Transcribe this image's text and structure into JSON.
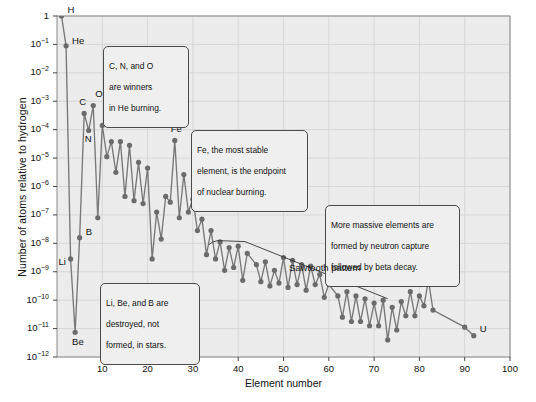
{
  "chart_data": {
    "type": "scatter",
    "title": "",
    "xlabel": "Element number",
    "ylabel": "Number of atoms relative to hydrogen",
    "xlim": [
      0,
      100
    ],
    "ylim_log10": [
      -12,
      0
    ],
    "xticks": [
      "10",
      "20",
      "30",
      "40",
      "50",
      "60",
      "70",
      "80",
      "90",
      "100"
    ],
    "xtick_values": [
      10,
      20,
      30,
      40,
      50,
      60,
      70,
      80,
      90,
      100
    ],
    "yticks": [
      "1",
      "10-1",
      "10-2",
      "10-3",
      "10-4",
      "10-5",
      "10-6",
      "10-7",
      "10-8",
      "10-9",
      "10-10",
      "10-11",
      "10-12"
    ],
    "ytick_exponents": [
      0,
      -1,
      -2,
      -3,
      -4,
      -5,
      -6,
      -7,
      -8,
      -9,
      -10,
      -11,
      -12
    ],
    "grid": true,
    "marker_color": "#6b6b6b",
    "line_color": "#777777",
    "plot_bg": "#ececec",
    "x": [
      1,
      2,
      3,
      4,
      5,
      6,
      7,
      8,
      9,
      10,
      11,
      12,
      13,
      14,
      15,
      16,
      17,
      18,
      19,
      20,
      21,
      22,
      23,
      24,
      25,
      26,
      27,
      28,
      29,
      30,
      31,
      32,
      33,
      34,
      35,
      36,
      37,
      38,
      39,
      40,
      41,
      42,
      44,
      45,
      46,
      47,
      48,
      49,
      50,
      51,
      52,
      53,
      54,
      55,
      56,
      57,
      58,
      59,
      60,
      62,
      63,
      64,
      65,
      66,
      67,
      68,
      69,
      70,
      71,
      72,
      73,
      74,
      75,
      76,
      77,
      78,
      79,
      80,
      81,
      82,
      83,
      90,
      92
    ],
    "y_log10": [
      0,
      -1.05,
      -8.55,
      -11.13,
      -7.8,
      -3.43,
      -4.03,
      -3.15,
      -7.1,
      -3.85,
      -4.95,
      -4.42,
      -5.5,
      -4.42,
      -6.35,
      -4.55,
      -6.5,
      -5.15,
      -6.6,
      -5.35,
      -8.55,
      -6.9,
      -7.85,
      -6.35,
      -6.55,
      -4.38,
      -7.1,
      -5.58,
      -6.9,
      -6.45,
      -7.55,
      -7.15,
      -8.4,
      -7.55,
      -8.55,
      -7.95,
      -8.95,
      -8.15,
      -8.85,
      -8.1,
      -9.3,
      -8.35,
      -8.75,
      -9.35,
      -8.65,
      -9.5,
      -8.95,
      -9.4,
      -8.5,
      -9.55,
      -8.6,
      -9.45,
      -8.75,
      -9.65,
      -8.8,
      -9.45,
      -9.1,
      -9.9,
      -9.45,
      -9.85,
      -10.6,
      -9.7,
      -10.75,
      -9.85,
      -10.75,
      -9.95,
      -10.9,
      -10.1,
      -10.9,
      -10.0,
      -11.4,
      -10.25,
      -11.05,
      -10.05,
      -10.55,
      -9.7,
      -10.55,
      -9.85,
      -10.2,
      -9.3,
      -10.35,
      -10.95,
      -11.25
    ],
    "labeled_points": [
      {
        "label": "H",
        "element": 1,
        "log10": 0
      },
      {
        "label": "He",
        "element": 2,
        "log10": -1.05
      },
      {
        "label": "Li",
        "element": 3,
        "log10": -8.55
      },
      {
        "label": "Be",
        "element": 4,
        "log10": -11.13
      },
      {
        "label": "B",
        "element": 5,
        "log10": -7.8
      },
      {
        "label": "C",
        "element": 6,
        "log10": -3.43
      },
      {
        "label": "N",
        "element": 7,
        "log10": -4.03
      },
      {
        "label": "O",
        "element": 8,
        "log10": -3.15
      },
      {
        "label": "Fe",
        "element": 26,
        "log10": -4.38
      },
      {
        "label": "U",
        "element": 92,
        "log10": -11.25
      }
    ],
    "annotations": [
      {
        "name": "sawtooth",
        "text": "Sawtooth pattern"
      }
    ],
    "callouts": [
      {
        "name": "he-burning",
        "text": "C, N, and O\nare winners\nin He burning."
      },
      {
        "name": "iron-endpoint",
        "text": "Fe, the most stable\nelement, is the endpoint\nof nuclear burning."
      },
      {
        "name": "neutron-capture",
        "text": "More massive elements are\nformed by neutron capture\nfollowed by beta decay."
      },
      {
        "name": "light-destroyed",
        "text": "Li, Be, and B are\ndestroyed, not\nformed, in stars."
      }
    ]
  },
  "axis": {
    "ylabel": "Number of atoms relative to hydrogen",
    "xlabel": "Element number"
  },
  "ytick_labels": [
    {
      "mantissa": "1",
      "exp": ""
    },
    {
      "mantissa": "10",
      "exp": "−1"
    },
    {
      "mantissa": "10",
      "exp": "−2"
    },
    {
      "mantissa": "10",
      "exp": "−3"
    },
    {
      "mantissa": "10",
      "exp": "−4"
    },
    {
      "mantissa": "10",
      "exp": "−5"
    },
    {
      "mantissa": "10",
      "exp": "−6"
    },
    {
      "mantissa": "10",
      "exp": "−7"
    },
    {
      "mantissa": "10",
      "exp": "−8"
    },
    {
      "mantissa": "10",
      "exp": "−9"
    },
    {
      "mantissa": "10",
      "exp": "−10"
    },
    {
      "mantissa": "10",
      "exp": "−11"
    },
    {
      "mantissa": "10",
      "exp": "−12"
    }
  ],
  "xtick_labels": [
    "10",
    "20",
    "30",
    "40",
    "50",
    "60",
    "70",
    "80",
    "90",
    "100"
  ],
  "callouts": {
    "he_burning": {
      "line1": "C, N, and O",
      "line2": "are winners",
      "line3": "in He burning."
    },
    "iron_endpoint": {
      "line1": "Fe, the most stable",
      "line2": "element, is the endpoint",
      "line3": "of nuclear burning."
    },
    "neutron_capture": {
      "line1": "More massive elements are",
      "line2": "formed by neutron capture",
      "line3": "followed by beta decay."
    },
    "light_destroyed": {
      "line1": "Li, Be, and B are",
      "line2": "destroyed, not",
      "line3": "formed, in stars."
    }
  },
  "sawtooth_annotation": "Sawtooth pattern",
  "point_labels": {
    "H": "H",
    "He": "He",
    "Li": "Li",
    "Be": "Be",
    "B": "B",
    "C": "C",
    "N": "N",
    "O": "O",
    "Fe": "Fe",
    "U": "U"
  }
}
